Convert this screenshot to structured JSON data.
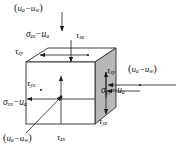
{
  "figure": {
    "type": "stress-cube-diagram",
    "symbols": {
      "sigma": "σ",
      "tau": "τ",
      "minus": "−"
    },
    "colors": {
      "line": "#1a1a1a",
      "cube_edge": "#2b2b2b",
      "right_face_fill": "#b8b8b8",
      "top_face_fill": "#ffffff",
      "front_face_fill": "#ffffff",
      "arrow": "#1a1a1a",
      "background": "#ffffff"
    }
  },
  "labels": {
    "suction_top": {
      "pre": "(",
      "sym": "u",
      "sub1": "a",
      "op": "−",
      "sym2": "u",
      "sub2": "w",
      "post": ")"
    },
    "suction_right": {
      "pre": "(",
      "sym": "u",
      "sub1": "a",
      "op": "−",
      "sym2": "u",
      "sub2": "w",
      "post": ")"
    },
    "suction_bottom": {
      "pre": "(",
      "sym": "u",
      "sub1": "a",
      "op": "−",
      "sym2": "u",
      "sub2": "w",
      "post": ")"
    },
    "sigma_zz": {
      "sym": "σ",
      "sub": "zz",
      "op": "−",
      "sym2": "u",
      "sub2": "a"
    },
    "sigma_xx": {
      "sym": "σ",
      "sub": "xx",
      "op": "−",
      "sym2": "u",
      "sub2": "a"
    },
    "sigma_yy": {
      "sym": "σ",
      "sub": "yy",
      "op": "−",
      "sym2": "u",
      "sub2": "a"
    },
    "tau_xz": {
      "sym": "τ",
      "sub": "xz"
    },
    "tau_zy": {
      "sym": "τ",
      "sub": "zy"
    },
    "tau_yx": {
      "sym": "τ",
      "sub": "yx"
    },
    "tau_zx": {
      "sym": "τ",
      "sub": "zx"
    },
    "tau_xy": {
      "sym": "τ",
      "sub": "xy"
    },
    "tau_yz": {
      "sym": "τ",
      "sub": "yz"
    }
  },
  "text_plain": {
    "suction": "(ua − uw)",
    "sigma_zz": "σzz − ua",
    "sigma_xx": "σxx − ua",
    "sigma_yy": "σyy − ua",
    "tau_xz": "τxz",
    "tau_zy": "τzy",
    "tau_yx": "τyx",
    "tau_zx": "τzx",
    "tau_xy": "τxy",
    "tau_yz": "τyz"
  }
}
